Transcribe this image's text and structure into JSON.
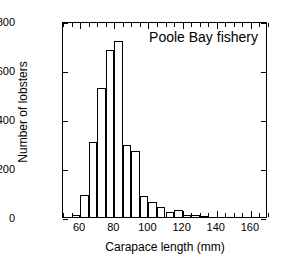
{
  "chart_data": {
    "type": "bar",
    "title": "Poole Bay fishery",
    "xlabel": "Carapace length (mm)",
    "ylabel": "Number of lobsters",
    "grid": false,
    "legend": "none",
    "xlim": [
      50,
      170
    ],
    "ylim": [
      0,
      800
    ],
    "bin_width": 5,
    "xticks": [
      60,
      80,
      100,
      120,
      140,
      160
    ],
    "xtick_labels": [
      "60",
      "80",
      "100",
      "120",
      "140",
      "160"
    ],
    "xminor_ticks": [
      50,
      55,
      65,
      70,
      75,
      85,
      90,
      95,
      105,
      110,
      115,
      125,
      130,
      135,
      145,
      150,
      155,
      165,
      170
    ],
    "yticks": [
      0,
      200,
      400,
      600,
      800
    ],
    "ytick_labels": [
      "0",
      "200",
      "400",
      "600",
      "800"
    ],
    "categories": [
      "55-60",
      "60-65",
      "65-70",
      "70-75",
      "75-80",
      "80-85",
      "85-90",
      "90-95",
      "95-100",
      "100-105",
      "105-110",
      "110-115",
      "115-120",
      "120-125",
      "125-130",
      "130-135"
    ],
    "bin_starts": [
      55,
      60,
      65,
      70,
      75,
      80,
      85,
      90,
      95,
      100,
      105,
      110,
      115,
      120,
      125,
      130
    ],
    "values": [
      10,
      90,
      305,
      525,
      680,
      720,
      293,
      268,
      85,
      62,
      42,
      22,
      27,
      10,
      7,
      4
    ]
  }
}
